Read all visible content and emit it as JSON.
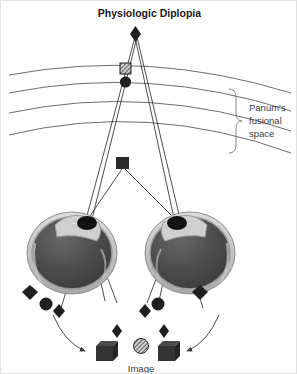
{
  "figure": {
    "title": "Physiologic Diplopia",
    "caption": "Image",
    "width": 297,
    "height": 374,
    "background_color": "#ffffff",
    "border_color": "#e2e2e2"
  },
  "annotations": {
    "panum_line1": "Panum's",
    "panum_line2": "fusional",
    "panum_line3": "space"
  },
  "colors": {
    "ray_line": "#1f1f1f",
    "horopter_line": "#6d6d6d",
    "brace_line": "#7a7a7a",
    "marker_dark": "#2a2a2a",
    "marker_mid": "#3a3a3a",
    "sclera_outer": "#c9c9c9",
    "sclera_ring": "#9a9a9a",
    "vitreous": "#4e4e4e",
    "cornea_highlight": "#d8d8d8",
    "text_dark": "#1a1a1a",
    "text_gray": "#3b3b3b"
  },
  "objects": {
    "fixation_point": {
      "shape": "diamond",
      "x": 134,
      "y": 32,
      "label": "fixation-target-diamond"
    },
    "horopter_marker_square": {
      "shape": "square-hatched",
      "x": 124,
      "y": 68,
      "label": "horopter-square-marker"
    },
    "horopter_marker_circle": {
      "shape": "circle",
      "x": 124,
      "y": 80,
      "label": "horopter-circle-marker"
    },
    "near_object": {
      "shape": "square",
      "x": 121,
      "y": 163,
      "label": "near-object-square"
    }
  },
  "horopter_curves": [
    {
      "index": 1,
      "d": "M 8 74 Q 148 48 290 92"
    },
    {
      "index": 2,
      "d": "M 8 92 Q 148 64 290 110"
    },
    {
      "index": 3,
      "d": "M 8 112 Q 148 82 290 130"
    },
    {
      "index": 4,
      "d": "M 8 134 Q 148 100 290 152"
    }
  ],
  "eyes": [
    {
      "side": "left",
      "cx": 71,
      "cy": 252,
      "rx": 44,
      "ry": 40,
      "pupil_x": 86,
      "pupil_y": 222
    },
    {
      "side": "right",
      "cx": 189,
      "cy": 252,
      "rx": 44,
      "ry": 40,
      "pupil_x": 176,
      "pupil_y": 222
    }
  ],
  "retinal_markers": [
    {
      "eye": "left",
      "shape": "diamond",
      "x": 29,
      "y": 291
    },
    {
      "eye": "left",
      "shape": "circle",
      "x": 44,
      "y": 303
    },
    {
      "eye": "left",
      "shape": "diamond",
      "x": 57,
      "y": 310
    },
    {
      "eye": "right",
      "shape": "diamond",
      "x": 143,
      "y": 310
    },
    {
      "eye": "right",
      "shape": "circle",
      "x": 157,
      "y": 303
    },
    {
      "eye": "right",
      "shape": "diamond",
      "x": 199,
      "y": 291
    }
  ],
  "perceived_image": [
    {
      "shape": "diamond",
      "x": 116,
      "y": 329,
      "label": "perceived-diamond-left"
    },
    {
      "shape": "cube",
      "x": 104,
      "y": 344,
      "label": "perceived-cube-left"
    },
    {
      "shape": "circle-hatched",
      "x": 140,
      "y": 342,
      "label": "perceived-fused-circle"
    },
    {
      "shape": "diamond",
      "x": 163,
      "y": 329,
      "label": "perceived-diamond-right"
    },
    {
      "shape": "cube",
      "x": 163,
      "y": 344,
      "label": "perceived-cube-right"
    }
  ],
  "arrows": [
    {
      "side": "left",
      "d": "M 52 312 Q 66 342 88 349",
      "label": "projection-arrow-left"
    },
    {
      "side": "right",
      "d": "M 218 312 Q 204 342 182 349",
      "label": "projection-arrow-right"
    }
  ],
  "rays": [
    {
      "d": "M 134 34 L 86 222",
      "label": "ray-fixation-to-left-node"
    },
    {
      "d": "M 134 34 L 176 222",
      "label": "ray-fixation-to-right-node"
    },
    {
      "d": "M 121 165 L 86 222",
      "label": "ray-near-to-left-node"
    },
    {
      "d": "M 121 165 L 176 222",
      "label": "ray-near-to-right-node"
    },
    {
      "d": "M 86 222 L 113 300",
      "label": "ray-left-node-to-retina-a"
    },
    {
      "d": "M 86 222 L 57 305",
      "label": "ray-left-node-to-retina-b"
    },
    {
      "d": "M 176 222 L 149 300",
      "label": "ray-right-node-to-retina-a"
    },
    {
      "d": "M 176 222 L 205 305",
      "label": "ray-right-node-to-retina-b"
    }
  ]
}
